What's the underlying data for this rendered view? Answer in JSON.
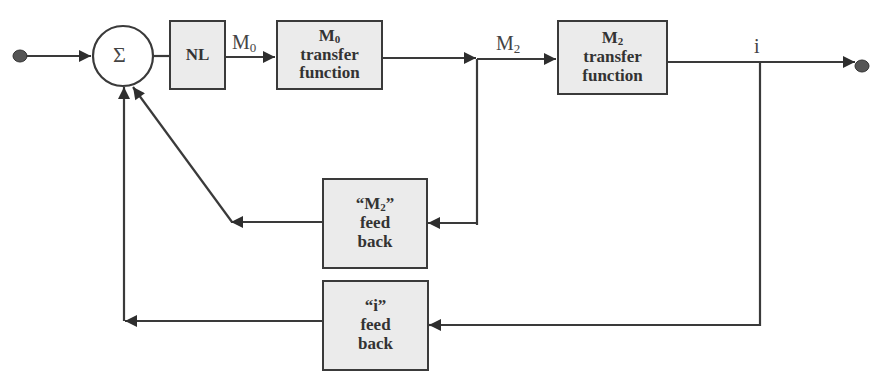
{
  "diagram": {
    "type": "block-diagram",
    "colors": {
      "line": "#3a3a3a",
      "block_fill": "#ebebeb",
      "terminal": "#555555",
      "text": "#333333"
    },
    "summing_junction": {
      "symbol": "Σ"
    },
    "blocks": {
      "nl": {
        "lines": [
          "NL"
        ]
      },
      "m0_tf": {
        "title": "M",
        "title_sub": "0",
        "lines": [
          "transfer",
          "function"
        ]
      },
      "m2_tf": {
        "title": "M",
        "title_sub": "2",
        "lines": [
          "transfer",
          "function"
        ]
      },
      "m2_fb": {
        "title_open": "“M",
        "title_sub": "2",
        "title_close": "”",
        "lines": [
          "feed",
          "back"
        ]
      },
      "i_fb": {
        "title": "“i”",
        "lines": [
          "feed",
          "back"
        ]
      }
    },
    "signals": {
      "m0": {
        "base": "M",
        "sub": "0"
      },
      "m2": {
        "base": "M",
        "sub": "2"
      },
      "i": {
        "base": "i"
      }
    },
    "connections": [
      "input → Σ",
      "Σ → NL",
      "NL → M0 transfer function (M0)",
      "M0 transfer function → junction (M2)",
      "junction → M2 transfer function",
      "M2 transfer function → output (i)",
      "junction (M2) → “M2” feed back → Σ",
      "output (i) → “i” feed back → Σ"
    ]
  }
}
